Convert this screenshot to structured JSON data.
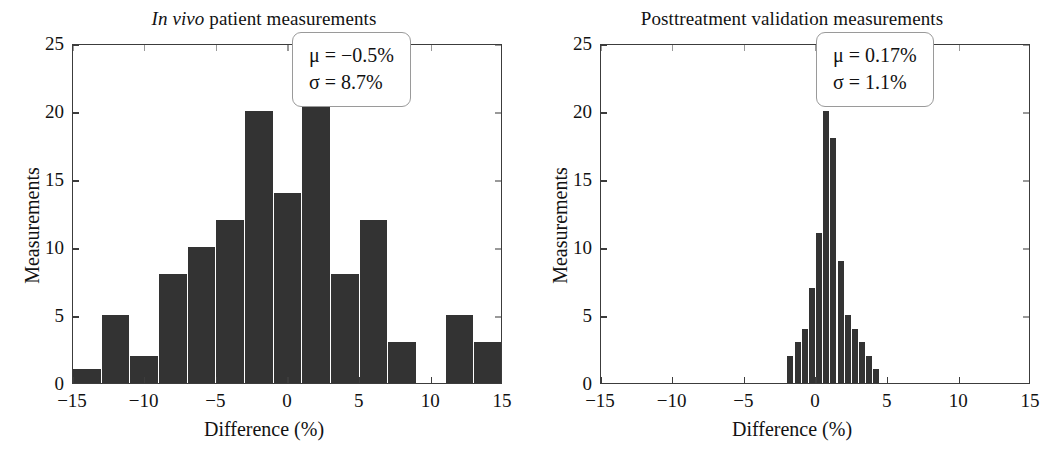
{
  "figure": {
    "background_color": "#ffffff",
    "bar_color": "#333333",
    "axis_color": "#3c3c3c",
    "text_color": "#121212"
  },
  "panels": [
    {
      "id": "in-vivo",
      "title_italic": "In vivo",
      "title_rest": " patient measurements",
      "title_full": "In vivo patient measurements",
      "xlabel": "Difference (%)",
      "ylabel": "Measurements",
      "stats_mu": "μ = −0.5%",
      "stats_sigma": "σ = 8.7%",
      "xticks": [
        "−15",
        "−10",
        "−5",
        "0",
        "5",
        "10",
        "15"
      ],
      "yticks": [
        "0",
        "5",
        "10",
        "15",
        "20",
        "25"
      ]
    },
    {
      "id": "posttreatment",
      "title_italic": "",
      "title_rest": "Posttreatment validation measurements",
      "title_full": "Posttreatment validation measurements",
      "xlabel": "Difference (%)",
      "ylabel": "Measurements",
      "stats_mu": "μ = 0.17%",
      "stats_sigma": "σ = 1.1%",
      "xticks": [
        "−15",
        "−10",
        "−5",
        "0",
        "5",
        "10",
        "15"
      ],
      "yticks": [
        "0",
        "5",
        "10",
        "15",
        "20",
        "25"
      ]
    }
  ],
  "chart_data": [
    {
      "type": "bar",
      "title": "In vivo patient measurements",
      "xlabel": "Difference (%)",
      "ylabel": "Measurements",
      "xlim": [
        -15,
        15
      ],
      "ylim": [
        0,
        25
      ],
      "xticks": [
        -15,
        -10,
        -5,
        0,
        5,
        10,
        15
      ],
      "yticks": [
        0,
        5,
        10,
        15,
        20,
        25
      ],
      "grid": false,
      "legend": "none",
      "bin_width": 2,
      "bin_edges": [
        -15,
        -13,
        -11,
        -9,
        -7,
        -5,
        -3,
        -1,
        1,
        3,
        5,
        7,
        9,
        11,
        13,
        15
      ],
      "bin_centers": [
        -14,
        -12,
        -10,
        -8,
        -6,
        -4,
        -2,
        0,
        2,
        4,
        6,
        8,
        10,
        12,
        14
      ],
      "values": [
        1,
        5,
        2,
        8,
        10,
        12,
        20,
        14,
        23,
        8,
        12,
        3,
        0,
        5,
        3
      ],
      "annotations": [
        "μ = −0.5%",
        "σ = 8.7%"
      ]
    },
    {
      "type": "bar",
      "title": "Posttreatment validation measurements",
      "xlabel": "Difference (%)",
      "ylabel": "Measurements",
      "xlim": [
        -15,
        15
      ],
      "ylim": [
        0,
        25
      ],
      "xticks": [
        -15,
        -10,
        -5,
        0,
        5,
        10,
        15
      ],
      "yticks": [
        0,
        5,
        10,
        15,
        20,
        25
      ],
      "grid": false,
      "legend": "none",
      "bin_width": 0.5,
      "bin_edges": [
        -2,
        -1.5,
        -1,
        -0.5,
        0,
        0.5,
        1,
        1.5,
        2,
        2.5,
        3,
        3.5,
        4,
        4.5
      ],
      "bin_centers": [
        -1.75,
        -1.25,
        -0.75,
        -0.25,
        0.25,
        0.75,
        1.25,
        1.75,
        2.25,
        2.75,
        3.25,
        3.75,
        4.25
      ],
      "values": [
        2,
        3,
        4,
        7,
        11,
        20,
        18,
        9,
        5,
        4,
        3,
        2,
        1
      ],
      "annotations": [
        "μ = 0.17%",
        "σ = 1.1%"
      ]
    }
  ]
}
